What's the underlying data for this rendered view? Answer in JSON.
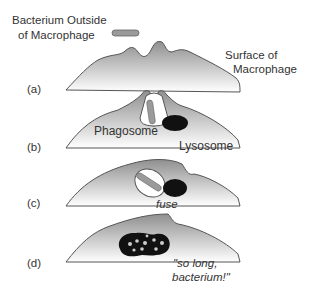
{
  "title_label": {
    "line1": "Bacterium Outside",
    "line2": "of Macrophage"
  },
  "surface_label": {
    "line1": "Surface of",
    "line2": "Macrophage"
  },
  "stages": [
    {
      "id": "a",
      "label": "(a)"
    },
    {
      "id": "b",
      "label": "(b)",
      "labels": {
        "phagosome": "Phagosome",
        "lysosome": "Lysosome"
      }
    },
    {
      "id": "c",
      "label": "(c)",
      "caption": "fuse"
    },
    {
      "id": "d",
      "label": "(d)",
      "caption_line1": "\"so long,",
      "caption_line2": "bacterium!\""
    }
  ],
  "colors": {
    "cell_top": "#8f8f8f",
    "cell_bottom": "#ffffff",
    "outline": "#555555",
    "bacterium": "#9a9a9a",
    "lysosome": "#111111"
  }
}
